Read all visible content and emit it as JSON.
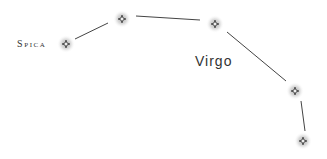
{
  "diagram": {
    "type": "constellation",
    "title": "Virgo",
    "star_label": "Spica",
    "colors": {
      "line": "#444444",
      "star": "#555555",
      "glow": "#bbbbbb",
      "text": "#333333"
    },
    "stars": [
      {
        "name": "Spica",
        "x": 66,
        "y": 44
      },
      {
        "name": "star-2",
        "x": 122,
        "y": 19
      },
      {
        "name": "star-3",
        "x": 215,
        "y": 24
      },
      {
        "name": "star-4",
        "x": 295,
        "y": 91
      },
      {
        "name": "star-5",
        "x": 303,
        "y": 141
      }
    ],
    "lines": [
      {
        "from": [
          75,
          39
        ],
        "to": [
          108,
          23
        ]
      },
      {
        "from": [
          136,
          16
        ],
        "to": [
          200,
          20
        ]
      },
      {
        "from": [
          227,
          32
        ],
        "to": [
          286,
          81
        ]
      },
      {
        "from": [
          301,
          101
        ],
        "to": [
          305,
          131
        ]
      }
    ]
  }
}
